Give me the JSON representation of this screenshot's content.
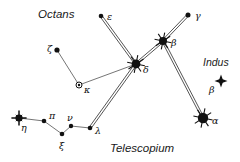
{
  "figure": {
    "width": 240,
    "height": 162,
    "background_color": "#ffffff",
    "ink_color": "#111111",
    "line_color": "#2a2a2a"
  },
  "constellation_labels": [
    {
      "id": "octans",
      "text": "Octans",
      "x": 38,
      "y": 18,
      "size": 11.5
    },
    {
      "id": "indus",
      "text": "Indus",
      "x": 203,
      "y": 66,
      "size": 10.5
    },
    {
      "id": "telescopium",
      "text": "Telescopium",
      "x": 110,
      "y": 152,
      "size": 11.5
    }
  ],
  "stars": [
    {
      "id": "epsilon-pav",
      "label": "ε",
      "x": 101,
      "y": 16,
      "type": "dot",
      "size": 2.3,
      "label_x": 107,
      "label_y": 20
    },
    {
      "id": "gamma-pav",
      "label": "γ",
      "x": 188,
      "y": 15,
      "type": "dot",
      "size": 2.5,
      "label_x": 195,
      "label_y": 19
    },
    {
      "id": "beta-pav",
      "label": "β",
      "x": 163,
      "y": 41,
      "type": "bright",
      "size": 4.0,
      "label_x": 171,
      "label_y": 46
    },
    {
      "id": "delta-pav",
      "label": "δ",
      "x": 136,
      "y": 64,
      "type": "bright",
      "size": 4.4,
      "label_x": 143,
      "label_y": 73
    },
    {
      "id": "zeta-pav",
      "label": "ζ",
      "x": 57,
      "y": 50,
      "type": "dot",
      "size": 2.6,
      "label_x": 47,
      "label_y": 52
    },
    {
      "id": "kappa-pav",
      "label": "κ",
      "x": 79,
      "y": 85,
      "type": "variable",
      "size": 3.0,
      "label_x": 84,
      "label_y": 93
    },
    {
      "id": "eta-pav",
      "label": "η",
      "x": 19,
      "y": 118,
      "type": "bright4",
      "size": 3.6,
      "label_x": 21,
      "label_y": 131
    },
    {
      "id": "pi-pav",
      "label": "π",
      "x": 44,
      "y": 121,
      "type": "dot",
      "size": 2.3,
      "label_x": 49,
      "label_y": 119
    },
    {
      "id": "xi-pav",
      "label": "ξ",
      "x": 62,
      "y": 134,
      "type": "dot",
      "size": 2.3,
      "label_x": 59,
      "label_y": 149
    },
    {
      "id": "nu-pav",
      "label": "ν",
      "x": 71,
      "y": 126,
      "type": "dot",
      "size": 2.2,
      "label_x": 67,
      "label_y": 121
    },
    {
      "id": "lambda-pav",
      "label": "λ",
      "x": 90,
      "y": 128,
      "type": "dot",
      "size": 2.3,
      "label_x": 95,
      "label_y": 134
    },
    {
      "id": "alpha-pav",
      "label": "α",
      "x": 203,
      "y": 118,
      "type": "bright",
      "size": 5.2,
      "label_x": 212,
      "label_y": 124
    },
    {
      "id": "beta-ind",
      "label": "β",
      "x": 221,
      "y": 81,
      "type": "diamond",
      "size": 6.5,
      "label_x": 209,
      "label_y": 93
    }
  ],
  "lines": {
    "double": [
      [
        "epsilon-pav",
        "delta-pav"
      ],
      [
        "gamma-pav",
        "beta-pav"
      ],
      [
        "beta-pav",
        "delta-pav"
      ],
      [
        "beta-pav",
        "alpha-pav"
      ],
      [
        "delta-pav",
        "lambda-pav"
      ]
    ],
    "single": [
      [
        "zeta-pav",
        "kappa-pav"
      ],
      [
        "kappa-pav",
        "delta-pav"
      ],
      [
        "eta-pav",
        "pi-pav"
      ],
      [
        "pi-pav",
        "xi-pav"
      ],
      [
        "xi-pav",
        "nu-pav"
      ],
      [
        "nu-pav",
        "lambda-pav"
      ]
    ]
  }
}
